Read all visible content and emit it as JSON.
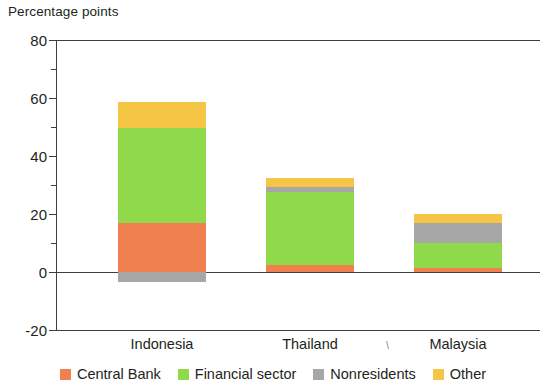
{
  "chart_data": {
    "type": "bar",
    "title": "Percentage points",
    "subtitle": "",
    "xlabel": "",
    "ylabel": "Percentage points",
    "stacked": true,
    "grid": false,
    "legend_position": "bottom",
    "ylim": [
      -20,
      80
    ],
    "yticks": [
      -20,
      0,
      20,
      40,
      60,
      80
    ],
    "ytick_labels": [
      "-20",
      "0",
      "20",
      "40",
      "60",
      "80"
    ],
    "yminor_ticks": [
      10,
      30,
      50,
      70
    ],
    "categories": [
      "Indonesia",
      "Thailand",
      "Malaysia"
    ],
    "series": [
      {
        "name": "Central Bank",
        "color": "#f18051",
        "values": [
          17.0,
          2.5,
          1.5
        ]
      },
      {
        "name": "Financial sector",
        "color": "#8fd94b",
        "values": [
          32.5,
          25.0,
          8.5
        ]
      },
      {
        "name": "Nonresidents",
        "color": "#a7a7a7",
        "values": [
          -3.5,
          1.8,
          7.0
        ]
      },
      {
        "name": "Other",
        "color": "#f5c645",
        "values": [
          9.0,
          3.0,
          3.0
        ]
      }
    ],
    "totals": [
      57.5,
      32.0,
      20.0
    ],
    "annotations": []
  },
  "axis": {
    "title": "Percentage points",
    "y_labels": [
      "80",
      "60",
      "40",
      "20",
      "0",
      "-20"
    ],
    "x_labels": [
      "Indonesia",
      "Thailand",
      "Malaysia"
    ],
    "stray_mark": "/"
  },
  "legend": {
    "items": [
      {
        "label": "Central Bank",
        "color": "#f18051"
      },
      {
        "label": "Financial sector",
        "color": "#8fd94b"
      },
      {
        "label": "Nonresidents",
        "color": "#a7a7a7"
      },
      {
        "label": "Other",
        "color": "#f5c645"
      }
    ]
  }
}
